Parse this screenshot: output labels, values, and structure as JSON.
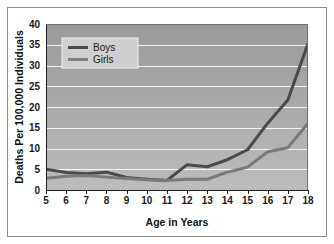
{
  "chart_data": {
    "type": "line",
    "title": "",
    "xlabel": "Age in Years",
    "ylabel": "Deaths Per 100,000 Individuals",
    "x": [
      5,
      6,
      7,
      8,
      9,
      10,
      11,
      12,
      13,
      14,
      15,
      16,
      17,
      18
    ],
    "xtick_labels": [
      "5",
      "6",
      "7",
      "8",
      "9",
      "10",
      "11",
      "12",
      "13",
      "14",
      "15",
      "16",
      "17",
      "18"
    ],
    "ytick_labels": [
      "0",
      "5",
      "10",
      "15",
      "20",
      "25",
      "30",
      "35",
      "40"
    ],
    "yticks": [
      0,
      5,
      10,
      15,
      20,
      25,
      30,
      35,
      40
    ],
    "ylim": [
      0,
      40
    ],
    "xlim": [
      5,
      18
    ],
    "grid": "horizontal",
    "legend_position": "upper-left-inside",
    "series": [
      {
        "name": "Boys",
        "color": "#4a4a4a",
        "values": [
          5.0,
          4.2,
          3.9,
          4.3,
          3.0,
          2.6,
          2.3,
          6.1,
          5.6,
          7.3,
          9.7,
          16.1,
          21.7,
          35.3
        ]
      },
      {
        "name": "Girls",
        "color": "#7a7a7a",
        "values": [
          2.8,
          3.3,
          3.5,
          3.1,
          2.8,
          2.5,
          2.3,
          2.6,
          2.6,
          4.3,
          5.5,
          9.2,
          10.2,
          16.1
        ]
      }
    ],
    "plot_bg_top_color": "#9e9e9e",
    "plot_bg_bottom_color": "#b8b8b8",
    "gridline_color": "#f2f2f2",
    "axis_color": "#222222",
    "figure_bg": "#ffffff"
  },
  "legend": {
    "items": [
      {
        "label": "Boys"
      },
      {
        "label": "Girls"
      }
    ]
  }
}
